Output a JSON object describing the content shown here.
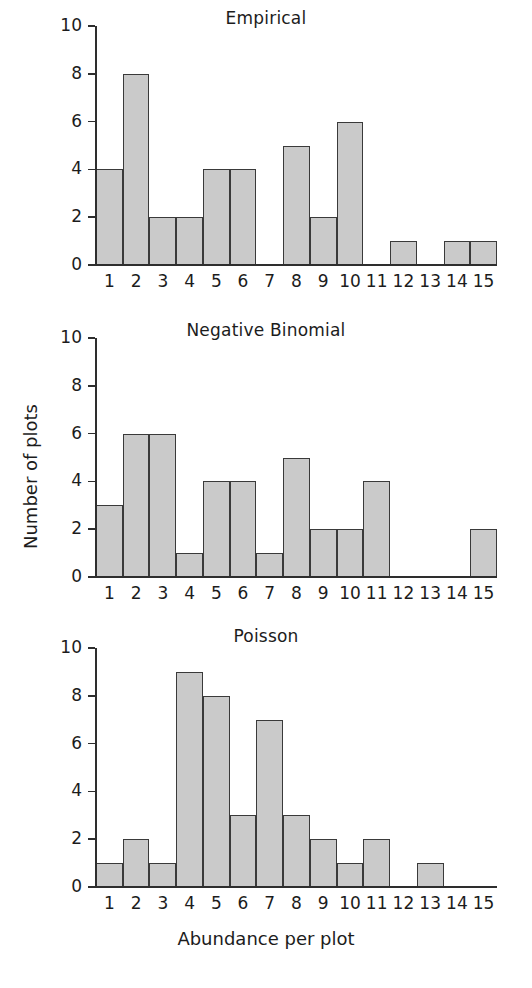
{
  "figure": {
    "width": 532,
    "height": 988,
    "background": "#ffffff",
    "bar_fill": "#cacaca",
    "bar_stroke": "#3a3a3a",
    "axis_color": "#2e2e2e"
  },
  "axis_labels": {
    "ylabel": "Number of plots",
    "xlabel": "Abundance per plot"
  },
  "chart_data": [
    {
      "type": "bar",
      "title": "Empirical",
      "xlabel": "",
      "ylabel": "Number of plots",
      "categories": [
        "1",
        "2",
        "3",
        "4",
        "5",
        "6",
        "7",
        "8",
        "9",
        "10",
        "11",
        "12",
        "13",
        "14",
        "15"
      ],
      "values": [
        4,
        8,
        2,
        2,
        4,
        4,
        0,
        5,
        2,
        6,
        0,
        1,
        0,
        1,
        1
      ],
      "yticks": [
        "0",
        "2",
        "4",
        "6",
        "8",
        "10"
      ],
      "ytick_values": [
        0,
        2,
        4,
        6,
        8,
        10
      ],
      "ylim": [
        0,
        10
      ],
      "grid": false,
      "legend": false
    },
    {
      "type": "bar",
      "title": "Negative Binomial",
      "xlabel": "",
      "ylabel": "Number of plots",
      "categories": [
        "1",
        "2",
        "3",
        "4",
        "5",
        "6",
        "7",
        "8",
        "9",
        "10",
        "11",
        "12",
        "13",
        "14",
        "15"
      ],
      "values": [
        3,
        6,
        6,
        1,
        4,
        4,
        1,
        5,
        2,
        2,
        4,
        0,
        0,
        0,
        2
      ],
      "yticks": [
        "0",
        "2",
        "4",
        "6",
        "8",
        "10"
      ],
      "ytick_values": [
        0,
        2,
        4,
        6,
        8,
        10
      ],
      "ylim": [
        0,
        10
      ],
      "grid": false,
      "legend": false
    },
    {
      "type": "bar",
      "title": "Poisson",
      "xlabel": "Abundance per plot",
      "ylabel": "Number of plots",
      "categories": [
        "1",
        "2",
        "3",
        "4",
        "5",
        "6",
        "7",
        "8",
        "9",
        "10",
        "11",
        "12",
        "13",
        "14",
        "15"
      ],
      "values": [
        1,
        2,
        1,
        9,
        8,
        3,
        7,
        3,
        2,
        1,
        2,
        0,
        1,
        0,
        0
      ],
      "yticks": [
        "0",
        "2",
        "4",
        "6",
        "8",
        "10"
      ],
      "ytick_values": [
        0,
        2,
        4,
        6,
        8,
        10
      ],
      "ylim": [
        0,
        10
      ],
      "grid": false,
      "legend": false
    }
  ],
  "layout": {
    "panels": [
      {
        "title_top": 8,
        "plot_left": 96,
        "plot_top": 26,
        "plot_width": 401,
        "plot_height": 239
      },
      {
        "title_top": 320,
        "plot_left": 96,
        "plot_top": 338,
        "plot_width": 401,
        "plot_height": 239
      },
      {
        "title_top": 626,
        "plot_left": 96,
        "plot_top": 648,
        "plot_width": 401,
        "plot_height": 239
      }
    ],
    "xlabel_top": 928,
    "ylabel_center_x": 30,
    "ylabel_center_y": 478
  }
}
